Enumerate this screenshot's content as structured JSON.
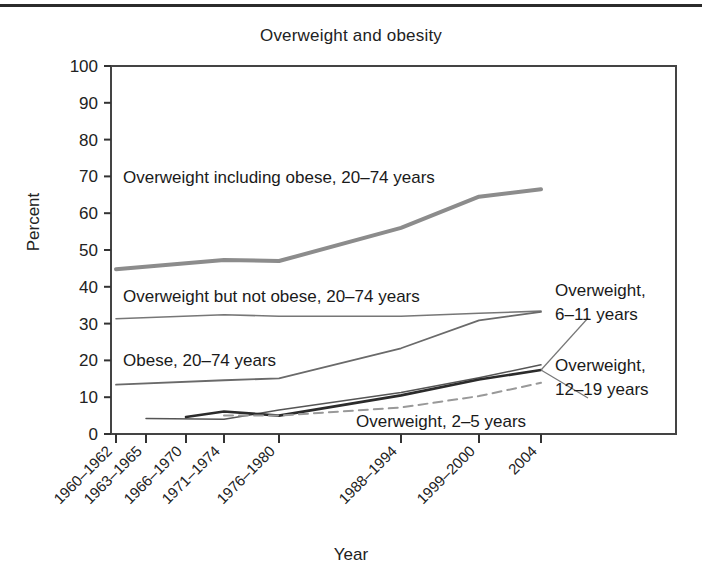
{
  "chart_data": {
    "type": "line",
    "title": "Overweight and obesity",
    "xlabel": "Year",
    "ylabel": "Percent",
    "ylim": [
      0,
      100
    ],
    "ytick_step": 10,
    "yticks": [
      0,
      10,
      20,
      30,
      40,
      50,
      60,
      70,
      80,
      90,
      100
    ],
    "grid": false,
    "legend_position": "inline-annotations",
    "categories": [
      "1960–1962",
      "1963–1965",
      "1966–1970",
      "1971–1974",
      "1976–1980",
      "1988–1994",
      "1999–2000",
      "2004"
    ],
    "series": [
      {
        "name": "Overweight including obese, 20–74 years",
        "style": "solid-thick-gray",
        "color": "#8c8c8c",
        "x": [
          "1960–1962",
          "1971–1974",
          "1976–1980",
          "1988–1994",
          "1999–2000",
          "2004"
        ],
        "values": [
          44.8,
          47.3,
          47.0,
          56.0,
          64.5,
          66.5
        ]
      },
      {
        "name": "Overweight but not obese, 20–74 years",
        "style": "solid-thin-gray",
        "color": "#777777",
        "x": [
          "1960–1962",
          "1971–1974",
          "1976–1980",
          "1988–1994",
          "1999–2000",
          "2004"
        ],
        "values": [
          31.3,
          32.4,
          32.0,
          32.0,
          32.8,
          33.4
        ]
      },
      {
        "name": "Obese, 20–74 years",
        "style": "solid-thin-dark",
        "color": "#6a6a6a",
        "x": [
          "1960–1962",
          "1971–1974",
          "1976–1980",
          "1988–1994",
          "1999–2000",
          "2004"
        ],
        "values": [
          13.4,
          14.6,
          15.1,
          23.3,
          30.9,
          33.2
        ]
      },
      {
        "name": "Overweight, 6–11 years",
        "style": "solid-thin-medium",
        "color": "#555555",
        "x": [
          "1963–1965",
          "1971–1974",
          "1976–1980",
          "1988–1994",
          "1999–2000",
          "2004"
        ],
        "values": [
          4.2,
          4.0,
          6.5,
          11.3,
          15.3,
          18.8
        ]
      },
      {
        "name": "Overweight, 12–19 years",
        "style": "solid-thick-dark",
        "color": "#2b2b2b",
        "x": [
          "1966–1970",
          "1971–1974",
          "1976–1980",
          "1988–1994",
          "1999–2000",
          "2004"
        ],
        "values": [
          4.6,
          6.1,
          5.0,
          10.5,
          14.8,
          17.4
        ]
      },
      {
        "name": "Overweight, 2–5 years",
        "style": "dashed-gray",
        "color": "#999999",
        "x": [
          "1971–1974",
          "1976–1980",
          "1988–1994",
          "1999–2000",
          "2004"
        ],
        "values": [
          5.0,
          5.0,
          7.2,
          10.3,
          13.9
        ]
      }
    ],
    "annotations": [
      {
        "id": "ann-overweight-including-obese",
        "text": "Overweight including obese, 20–74 years"
      },
      {
        "id": "ann-overweight-not-obese",
        "text": "Overweight but not obese, 20–74 years"
      },
      {
        "id": "ann-obese",
        "text": "Obese, 20–74 years"
      },
      {
        "id": "ann-overweight-2-5",
        "text": "Overweight, 2–5 years"
      },
      {
        "id": "ann-overweight-6-11-line1",
        "text": "Overweight,"
      },
      {
        "id": "ann-overweight-6-11-line2",
        "text": "6–11 years"
      },
      {
        "id": "ann-overweight-12-19-line1",
        "text": "Overweight,"
      },
      {
        "id": "ann-overweight-12-19-line2",
        "text": "12–19 years"
      }
    ]
  },
  "ytick_labels": [
    "100",
    "90",
    "80",
    "70",
    "60",
    "50",
    "40",
    "30",
    "20",
    "10",
    "0"
  ],
  "xtick_labels": [
    "1960–1962",
    "1963–1965",
    "1966–1970",
    "1971–1974",
    "1976–1980",
    "1988–1994",
    "1999–2000",
    "2004"
  ],
  "colors": {
    "axis": "#333333",
    "text": "#1a1a1a",
    "background": "#ffffff",
    "top_rule": "#2b2b2b"
  }
}
